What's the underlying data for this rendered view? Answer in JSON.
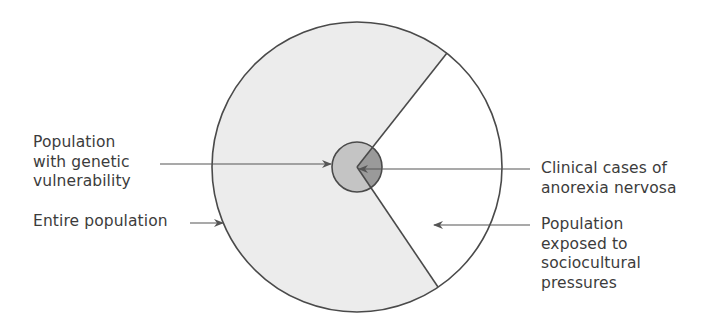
{
  "diagram": {
    "type": "nested-circle-sector",
    "colors": {
      "outline": "#4a4a4a",
      "entire_population_fill": "#ececec",
      "sociocultural_fill": "#ffffff",
      "genetic_fill": "#c4c4c4",
      "clinical_overlap_fill": "#9a9a9a",
      "arrow": "#555555"
    },
    "labels": {
      "genetic": {
        "lines": [
          "Population",
          "with genetic",
          "vulnerability"
        ]
      },
      "entire": {
        "lines": [
          "Entire population"
        ]
      },
      "clinical": {
        "lines": [
          "Clinical cases of",
          "anorexia nervosa"
        ]
      },
      "sociocultural": {
        "lines": [
          "Population",
          "exposed to",
          "sociocultural",
          "pressures"
        ]
      }
    }
  }
}
